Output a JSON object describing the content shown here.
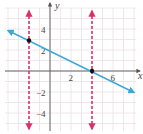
{
  "chart_data": {
    "type": "line",
    "title": "",
    "xlabel": "x",
    "ylabel": "y",
    "xlim": [
      -4.6,
      7.6
    ],
    "ylim": [
      -5.8,
      6.6
    ],
    "grid": true,
    "x_tick_labels": [
      {
        "value": 2,
        "label": "2"
      },
      {
        "value": 6,
        "label": "6"
      }
    ],
    "y_tick_labels": [
      {
        "value": 4,
        "label": "4"
      },
      {
        "value": 2,
        "label": "2"
      },
      {
        "value": -2,
        "label": "−2"
      },
      {
        "value": -4,
        "label": "−4"
      }
    ],
    "series": [
      {
        "name": "line y = -x/2 + 2",
        "kind": "line",
        "style": "solid",
        "color": "#3aa8d8",
        "arrows": "both",
        "x": [
          -4.2,
          7.8
        ],
        "y": [
          4.1,
          -1.9
        ]
      },
      {
        "name": "vertical line x = -2",
        "kind": "vline",
        "style": "dashed",
        "color": "#d6336c",
        "arrows": "both",
        "x": -2
      },
      {
        "name": "vertical line x = 4",
        "kind": "vline",
        "style": "dashed",
        "color": "#d6336c",
        "arrows": "both",
        "x": 4
      },
      {
        "name": "points",
        "kind": "scatter",
        "color": "#111111",
        "points": [
          {
            "x": -2,
            "y": 3
          },
          {
            "x": 4,
            "y": 0
          }
        ]
      }
    ]
  },
  "labels": {
    "x_axis": "x",
    "y_axis": "y",
    "xtick_2": "2",
    "xtick_6": "6",
    "ytick_4": "4",
    "ytick_2": "2",
    "ytick_m2": "−2",
    "ytick_m4": "−4"
  },
  "colors": {
    "grid": "#ecdfe3",
    "axis": "#555555",
    "line": "#3aa8d8",
    "dashed": "#d6336c",
    "point": "#111111"
  }
}
